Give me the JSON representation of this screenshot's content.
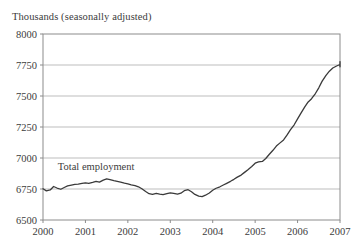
{
  "chart_data": {
    "type": "line",
    "title": "Thousands (seasonally adjusted)",
    "xlabel": "",
    "ylabel": "",
    "ylim": [
      6500,
      8000
    ],
    "xlim": [
      2000,
      2007
    ],
    "ytick_labels": [
      "6500",
      "6750",
      "7000",
      "7250",
      "7500",
      "7750",
      "8000"
    ],
    "ytick_values": [
      6500,
      6750,
      7000,
      7250,
      7500,
      7750,
      8000
    ],
    "xtick_labels": [
      "2000",
      "2001",
      "2002",
      "2003",
      "2004",
      "2005",
      "2006",
      "2007"
    ],
    "xtick_values": [
      2000,
      2001,
      2002,
      2003,
      2004,
      2005,
      2006,
      2007
    ],
    "grid": true,
    "grid_axis": "y",
    "legend_position": "inline-annotation",
    "series": [
      {
        "name": "Total employment",
        "color": "#3a3a3a",
        "annotation": "Total employment",
        "annotation_x": 2000.35,
        "annotation_y": 6905,
        "x": [
          2000.0,
          2000.08,
          2000.17,
          2000.25,
          2000.33,
          2000.42,
          2000.5,
          2000.58,
          2000.67,
          2000.75,
          2000.83,
          2000.92,
          2001.0,
          2001.08,
          2001.17,
          2001.25,
          2001.33,
          2001.42,
          2001.5,
          2001.58,
          2001.67,
          2001.75,
          2001.83,
          2001.92,
          2002.0,
          2002.08,
          2002.17,
          2002.25,
          2002.33,
          2002.42,
          2002.5,
          2002.58,
          2002.67,
          2002.75,
          2002.83,
          2002.92,
          2003.0,
          2003.08,
          2003.17,
          2003.25,
          2003.33,
          2003.42,
          2003.5,
          2003.58,
          2003.67,
          2003.75,
          2003.83,
          2003.92,
          2004.0,
          2004.08,
          2004.17,
          2004.25,
          2004.33,
          2004.42,
          2004.5,
          2004.58,
          2004.67,
          2004.75,
          2004.83,
          2004.92,
          2005.0,
          2005.08,
          2005.17,
          2005.25,
          2005.33,
          2005.42,
          2005.5,
          2005.58,
          2005.67,
          2005.75,
          2005.83,
          2005.92,
          2006.0,
          2006.08,
          2006.17,
          2006.25,
          2006.33,
          2006.42,
          2006.5,
          2006.58,
          2006.67,
          2006.75,
          2006.83,
          2006.92,
          2007.0
        ],
        "y": [
          6752,
          6735,
          6742,
          6770,
          6758,
          6748,
          6762,
          6775,
          6782,
          6788,
          6790,
          6795,
          6800,
          6796,
          6804,
          6812,
          6806,
          6822,
          6832,
          6826,
          6818,
          6812,
          6806,
          6798,
          6792,
          6784,
          6778,
          6768,
          6752,
          6730,
          6712,
          6706,
          6714,
          6708,
          6704,
          6712,
          6718,
          6714,
          6708,
          6716,
          6736,
          6744,
          6728,
          6706,
          6692,
          6688,
          6700,
          6718,
          6740,
          6756,
          6768,
          6782,
          6796,
          6812,
          6828,
          6846,
          6862,
          6884,
          6906,
          6932,
          6958,
          6968,
          6972,
          6996,
          7028,
          7062,
          7096,
          7120,
          7146,
          7184,
          7226,
          7268,
          7316,
          7362,
          7412,
          7452,
          7478,
          7520,
          7566,
          7620,
          7666,
          7700,
          7726,
          7742,
          7754
        ],
        "y_tail": [
          7758,
          7766,
          7772,
          7760,
          7748,
          7766,
          7778,
          7770,
          7756,
          7744,
          7736,
          7752,
          7738
        ]
      }
    ]
  },
  "plot_geometry": {
    "left": 43,
    "right": 340,
    "top": 34,
    "bottom": 220
  },
  "style": {
    "frame_color": "#8c8c8c",
    "grid_color": "#bdbdbd",
    "line_color": "#3a3a3a",
    "text_color": "#3c3c3c",
    "background": "#ffffff"
  }
}
